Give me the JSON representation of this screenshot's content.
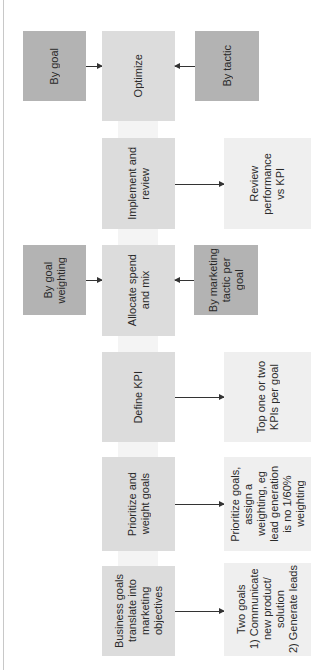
{
  "diagram": {
    "orientation": "rotated-90-ccw",
    "colors": {
      "input_box": "#b3b3b3",
      "step_box": "#dcdcdc",
      "output_box": "#efefef",
      "arrow": "#333333"
    },
    "steps": [
      {
        "id": "business-goals",
        "label": "Business goals\ntranslate into\nmarketing\nobjectives",
        "output": "Two goals\n1) Communicate\nnew product/\nsolution\n2) Generate leads"
      },
      {
        "id": "prioritize",
        "label": "Prioritize and\nweight goals",
        "output": "Prioritize goals,\nassign a\nweighting, eg\nlead generation\nis no 1/60%\nweighting"
      },
      {
        "id": "define-kpi",
        "label": "Define KPI",
        "output": "Top one or two\nKPIs per goal"
      },
      {
        "id": "allocate",
        "label": "Allocate spend\nand mix",
        "input_left": "By goal\nweighting",
        "input_right": "By marketing\ntactic per\ngoal"
      },
      {
        "id": "implement",
        "label": "Implement and\nreview",
        "output": "Review\nperformance\nvs KPI"
      },
      {
        "id": "optimize",
        "label": "Optimize",
        "input_left": "By goal",
        "input_right": "By tactic"
      }
    ]
  }
}
